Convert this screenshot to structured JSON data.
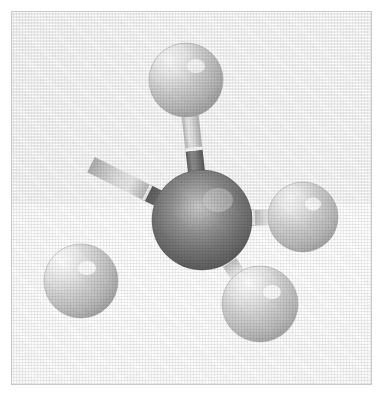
{
  "figure": {
    "kind": "ball-and-stick-molecular-model",
    "caption": "",
    "alt_text": "Ball-and-stick model of a methane molecule: one dark central carbon atom bonded to four lighter hydrogen atoms in a tetrahedral arrangement.",
    "molecule_name": "Methane",
    "molecular_formula": "CH4",
    "geometry": "tetrahedral",
    "render_style": "shaded grayscale spheres with two-tone cylindrical bonds, halftone scan texture",
    "canvas": {
      "width": 386,
      "height": 399
    }
  },
  "frame": {
    "name": "plate-border",
    "x": 11,
    "y": 11,
    "width": 361,
    "height": 374,
    "border_color": "#c9c9c9",
    "fill_color": "#fdfdfd"
  },
  "palette": {
    "background": "#ffffff",
    "plate_fill": "#fdfdfd",
    "frame_line": "#c9c9c9",
    "carbon_base": "#6e6e6e",
    "carbon_shadow": "#4d4d4d",
    "carbon_highlight": "#d2d2d2",
    "hydrogen_base": "#c4c4c4",
    "hydrogen_shadow": "#a0a0a0",
    "hydrogen_highlight": "#ffffff",
    "bond_light": "#d8d8d8",
    "bond_dark": "#7a7a7a",
    "bond_seam": "#ffffff"
  },
  "atoms": [
    {
      "id": "atom-carbon-center",
      "element": "C",
      "label": "carbon",
      "role": "central",
      "cx": 202,
      "cy": 220,
      "r": 50,
      "tone": "dark",
      "highlight": {
        "cx": 218,
        "cy": 200,
        "spread": 0.55
      }
    },
    {
      "id": "atom-hydrogen-top",
      "element": "H",
      "label": "hydrogen",
      "role": "terminal",
      "position": "top",
      "cx": 186,
      "cy": 80,
      "r": 37,
      "tone": "light",
      "highlight": {
        "cx": 196,
        "cy": 66,
        "spread": 0.6
      }
    },
    {
      "id": "atom-hydrogen-right",
      "element": "H",
      "label": "hydrogen",
      "role": "terminal",
      "position": "right",
      "cx": 303,
      "cy": 217,
      "r": 35,
      "tone": "light",
      "highlight": {
        "cx": 313,
        "cy": 204,
        "spread": 0.6
      }
    },
    {
      "id": "atom-hydrogen-lower-left",
      "element": "H",
      "label": "hydrogen",
      "role": "terminal",
      "position": "lower-left",
      "cx": 81,
      "cy": 281,
      "r": 37,
      "tone": "light",
      "highlight": {
        "cx": 87,
        "cy": 268,
        "spread": 0.6
      }
    },
    {
      "id": "atom-hydrogen-lower-right",
      "element": "H",
      "label": "hydrogen",
      "role": "terminal",
      "position": "lower-right",
      "cx": 260,
      "cy": 304,
      "r": 38,
      "tone": "light",
      "highlight": {
        "cx": 272,
        "cy": 292,
        "spread": 0.6
      }
    }
  ],
  "bonds": [
    {
      "id": "bond-c-h-top",
      "from": "atom-carbon-center",
      "to": "atom-hydrogen-top",
      "order": 1,
      "width": 17,
      "seam_offset": 0.47
    },
    {
      "id": "bond-c-h-right",
      "from": "atom-carbon-center",
      "to": "atom-hydrogen-right",
      "order": 1,
      "width": 16,
      "seam_offset": 0.5
    },
    {
      "id": "bond-c-h-lower-left",
      "from": "atom-carbon-center",
      "to": "atom-hydrogen-lower-left",
      "order": 1,
      "width": 17,
      "seam_offset": 0.47
    },
    {
      "id": "bond-c-h-lower-right",
      "from": "atom-carbon-center",
      "to": "atom-hydrogen-lower-right",
      "order": 1,
      "width": 16,
      "seam_offset": 0.5
    }
  ]
}
